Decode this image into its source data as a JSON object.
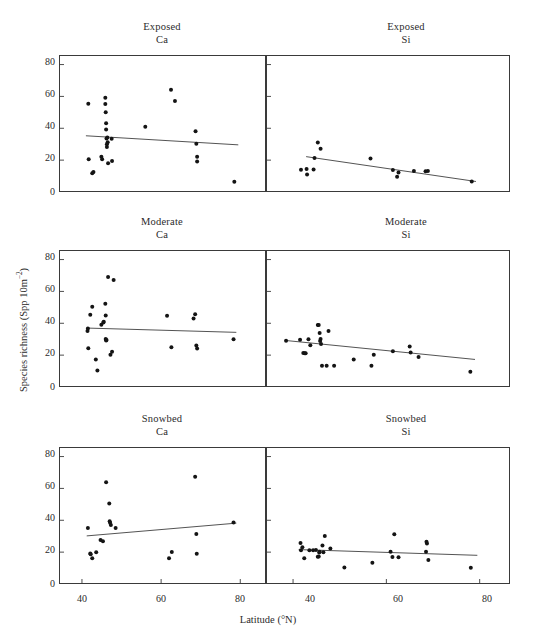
{
  "chart_data": {
    "type": "scatter",
    "title": "",
    "xlabel": "Latitude (°N)",
    "ylabel": "Species richness (Spp 10m−2)",
    "ylabel_parts": {
      "main": "Species richness (Spp 10m",
      "sup": "−2",
      "tail": ")"
    },
    "xlim": [
      34.2,
      86.5
    ],
    "ylim": [
      0,
      86
    ],
    "xticks": [
      40,
      60,
      80
    ],
    "yticks": [
      0,
      20,
      40,
      60,
      80
    ],
    "grid": false,
    "legend": "none",
    "marker_color": "#141414",
    "line_color": "#4a4a4a",
    "frame_color": "#3a3a3a",
    "panels": [
      {
        "id": "exposed-ca",
        "title_line1": "Exposed",
        "title_line2": "Ca",
        "row": 0,
        "col": 0,
        "points": [
          [
            41.6,
            55.4
          ],
          [
            41.7,
            20.6
          ],
          [
            42.6,
            11.8
          ],
          [
            42.9,
            12.6
          ],
          [
            44.9,
            22.1
          ],
          [
            45.1,
            20.6
          ],
          [
            45.9,
            59.2
          ],
          [
            45.9,
            55.2
          ],
          [
            46.0,
            50.0
          ],
          [
            46.1,
            43.1
          ],
          [
            46.1,
            39.2
          ],
          [
            46.2,
            33.6
          ],
          [
            46.3,
            30.0
          ],
          [
            46.3,
            28.2
          ],
          [
            46.4,
            34.2
          ],
          [
            46.5,
            31.3
          ],
          [
            46.6,
            18.0
          ],
          [
            47.5,
            33.5
          ],
          [
            47.6,
            19.4
          ],
          [
            56.0,
            41.0
          ],
          [
            62.5,
            64.2
          ],
          [
            63.5,
            57.1
          ],
          [
            68.7,
            38.1
          ],
          [
            68.9,
            30.3
          ],
          [
            69.1,
            22.2
          ],
          [
            69.1,
            19.1
          ],
          [
            78.5,
            6.5
          ]
        ],
        "trend": {
          "x0": 41.0,
          "y0": 35.3,
          "x1": 79.5,
          "y1": 29.6
        }
      },
      {
        "id": "exposed-si",
        "title_line1": "Exposed",
        "title_line2": "Si",
        "row": 0,
        "col": 1,
        "points": [
          [
            41.7,
            13.9
          ],
          [
            42.9,
            14.4
          ],
          [
            43.0,
            11.0
          ],
          [
            44.4,
            14.1
          ],
          [
            44.6,
            21.3
          ],
          [
            45.3,
            31.1
          ],
          [
            45.9,
            27.1
          ],
          [
            56.6,
            21.0
          ],
          [
            61.4,
            13.8
          ],
          [
            62.3,
            9.6
          ],
          [
            62.6,
            12.3
          ],
          [
            65.9,
            13.2
          ],
          [
            68.4,
            13.1
          ],
          [
            68.9,
            13.2
          ],
          [
            78.3,
            6.6
          ]
        ],
        "trend": {
          "x0": 42.8,
          "y0": 22.2,
          "x1": 79.2,
          "y1": 6.6
        }
      },
      {
        "id": "moderate-ca",
        "title_line1": "Moderate",
        "title_line2": "Ca",
        "row": 1,
        "col": 0,
        "points": [
          [
            41.4,
            35.1
          ],
          [
            41.5,
            36.8
          ],
          [
            41.6,
            24.4
          ],
          [
            42.1,
            45.3
          ],
          [
            42.6,
            50.4
          ],
          [
            43.5,
            17.2
          ],
          [
            43.9,
            10.4
          ],
          [
            44.9,
            39.0
          ],
          [
            45.4,
            40.5
          ],
          [
            45.5,
            40.9
          ],
          [
            45.9,
            52.3
          ],
          [
            46.0,
            44.9
          ],
          [
            46.0,
            30.1
          ],
          [
            46.1,
            29.2
          ],
          [
            46.2,
            29.5
          ],
          [
            46.6,
            69.1
          ],
          [
            47.2,
            20.3
          ],
          [
            47.6,
            22.1
          ],
          [
            48.0,
            67.1
          ],
          [
            61.5,
            44.7
          ],
          [
            62.6,
            25.0
          ],
          [
            68.2,
            43.0
          ],
          [
            68.6,
            45.6
          ],
          [
            68.9,
            26.1
          ],
          [
            69.1,
            24.1
          ],
          [
            78.3,
            30.0
          ]
        ],
        "trend": {
          "x0": 41.2,
          "y0": 37.0,
          "x1": 79.0,
          "y1": 34.3
        }
      },
      {
        "id": "moderate-si",
        "title_line1": "Moderate",
        "title_line2": "Si",
        "row": 1,
        "col": 1,
        "points": [
          [
            38.5,
            29.0
          ],
          [
            41.5,
            29.6
          ],
          [
            42.2,
            21.3
          ],
          [
            42.5,
            21.2
          ],
          [
            42.7,
            21.2
          ],
          [
            43.3,
            29.9
          ],
          [
            43.7,
            26.2
          ],
          [
            45.3,
            38.9
          ],
          [
            45.5,
            38.9
          ],
          [
            45.7,
            33.9
          ],
          [
            45.8,
            28.9
          ],
          [
            45.9,
            30.2
          ],
          [
            46.0,
            27.0
          ],
          [
            46.2,
            13.4
          ],
          [
            47.2,
            13.3
          ],
          [
            47.6,
            35.1
          ],
          [
            48.8,
            13.3
          ],
          [
            53.0,
            17.3
          ],
          [
            56.8,
            13.3
          ],
          [
            57.3,
            20.2
          ],
          [
            61.4,
            22.5
          ],
          [
            65.0,
            25.5
          ],
          [
            65.2,
            21.6
          ],
          [
            66.9,
            18.9
          ],
          [
            78.0,
            9.6
          ]
        ],
        "trend": {
          "x0": 38.4,
          "y0": 29.2,
          "x1": 79.0,
          "y1": 17.3
        }
      },
      {
        "id": "snowbed-ca",
        "title_line1": "Snowbed",
        "title_line2": "Ca",
        "row": 2,
        "col": 0,
        "points": [
          [
            41.5,
            35.1
          ],
          [
            42.1,
            19.2
          ],
          [
            42.2,
            18.6
          ],
          [
            42.6,
            16.1
          ],
          [
            43.6,
            20.0
          ],
          [
            44.7,
            27.6
          ],
          [
            45.3,
            26.8
          ],
          [
            46.1,
            63.9
          ],
          [
            46.9,
            50.5
          ],
          [
            47.0,
            39.4
          ],
          [
            47.1,
            38.4
          ],
          [
            47.3,
            37.0
          ],
          [
            48.5,
            35.1
          ],
          [
            62.0,
            16.1
          ],
          [
            62.7,
            20.1
          ],
          [
            68.6,
            67.3
          ],
          [
            68.9,
            31.4
          ],
          [
            69.0,
            19.0
          ],
          [
            78.3,
            38.6
          ]
        ],
        "trend": {
          "x0": 41.2,
          "y0": 30.2,
          "x1": 79.0,
          "y1": 38.2
        }
      },
      {
        "id": "snowbed-si",
        "title_line1": "Snowbed",
        "title_line2": "Si",
        "row": 2,
        "col": 1,
        "points": [
          [
            41.6,
            25.8
          ],
          [
            41.7,
            21.2
          ],
          [
            42.0,
            23.0
          ],
          [
            42.4,
            16.2
          ],
          [
            43.5,
            21.2
          ],
          [
            44.3,
            21.2
          ],
          [
            44.9,
            21.3
          ],
          [
            45.3,
            17.1
          ],
          [
            45.5,
            17.3
          ],
          [
            45.6,
            19.8
          ],
          [
            45.7,
            20.3
          ],
          [
            46.3,
            24.1
          ],
          [
            46.5,
            20.0
          ],
          [
            46.8,
            30.2
          ],
          [
            48.0,
            22.3
          ],
          [
            51.0,
            10.3
          ],
          [
            57.0,
            13.4
          ],
          [
            60.9,
            20.2
          ],
          [
            61.3,
            17.0
          ],
          [
            61.7,
            31.2
          ],
          [
            62.6,
            16.8
          ],
          [
            68.5,
            20.3
          ],
          [
            68.6,
            26.5
          ],
          [
            68.7,
            25.5
          ],
          [
            69.0,
            15.0
          ],
          [
            78.1,
            10.2
          ]
        ],
        "trend": {
          "x0": 41.2,
          "y0": 21.6,
          "x1": 79.5,
          "y1": 18.0
        }
      }
    ]
  }
}
